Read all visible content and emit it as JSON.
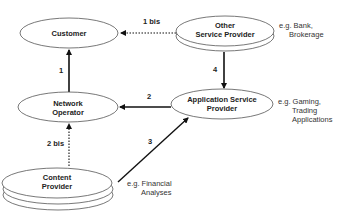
{
  "diagram": {
    "nodes": [
      {
        "id": "customer",
        "lines": [
          "Customer"
        ]
      },
      {
        "id": "other_sp",
        "lines": [
          "Other",
          "Service Provider"
        ],
        "note": [
          "e.g. Bank,",
          "Brokerage"
        ]
      },
      {
        "id": "network_operator",
        "lines": [
          "Network",
          "Operator"
        ]
      },
      {
        "id": "asp",
        "lines": [
          "Application Service",
          "Provider"
        ],
        "note": [
          "e.g. Gaming,",
          "Trading",
          "Applications"
        ]
      },
      {
        "id": "content_provider",
        "lines": [
          "Content",
          "Provider"
        ],
        "note": [
          "e.g. Financial",
          "Analyses"
        ]
      }
    ],
    "edges": [
      {
        "id": "e1",
        "from": "network_operator",
        "to": "customer",
        "label": "1",
        "style": "solid"
      },
      {
        "id": "e1bis",
        "from": "other_sp",
        "to": "customer",
        "label": "1 bis",
        "style": "dotted"
      },
      {
        "id": "e2",
        "from": "asp",
        "to": "network_operator",
        "label": "2",
        "style": "solid"
      },
      {
        "id": "e2bis",
        "from": "content_provider",
        "to": "network_operator",
        "label": "2 bis",
        "style": "dotted"
      },
      {
        "id": "e3",
        "from": "content_provider",
        "to": "asp",
        "label": "3",
        "style": "solid"
      },
      {
        "id": "e4",
        "from": "other_sp",
        "to": "asp",
        "label": "4",
        "style": "solid"
      }
    ]
  }
}
